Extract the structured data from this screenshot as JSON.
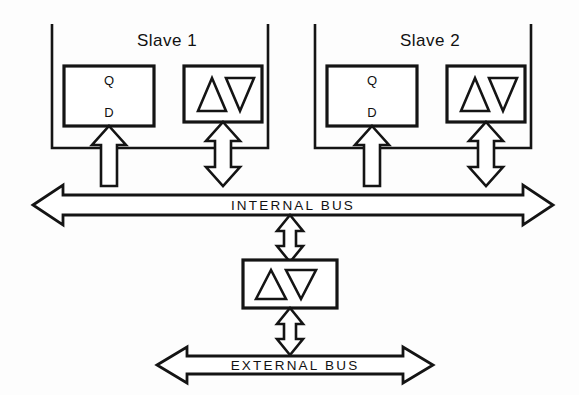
{
  "figure": {
    "background_color": "#fdfdfd",
    "line_color": "#141414"
  },
  "slaves": [
    {
      "id": "slave-1",
      "label": "Slave 1",
      "register": {
        "id": "register-1",
        "pin_top": "Q",
        "pin_bottom": "D"
      },
      "transceiver": {
        "id": "transceiver-1",
        "symbol": "triangle-up-triangle-down",
        "direction": "bidirectional"
      },
      "register_link_direction": "up",
      "transceiver_link_direction": "bidirectional"
    },
    {
      "id": "slave-2",
      "label": "Slave 2",
      "register": {
        "id": "register-2",
        "pin_top": "Q",
        "pin_bottom": "D"
      },
      "transceiver": {
        "id": "transceiver-2",
        "symbol": "triangle-up-triangle-down",
        "direction": "bidirectional"
      },
      "register_link_direction": "up",
      "transceiver_link_direction": "bidirectional"
    }
  ],
  "buses": [
    {
      "id": "internal-bus",
      "label": "INTERNAL BUS",
      "orientation": "horizontal",
      "direction": "bidirectional"
    },
    {
      "id": "external-bus",
      "label": "EXTERNAL BUS",
      "orientation": "horizontal",
      "direction": "bidirectional"
    }
  ],
  "main_transceiver": {
    "id": "transceiver-main",
    "symbol": "triangle-up-triangle-down",
    "link_up_direction": "bidirectional",
    "link_down_direction": "bidirectional"
  }
}
